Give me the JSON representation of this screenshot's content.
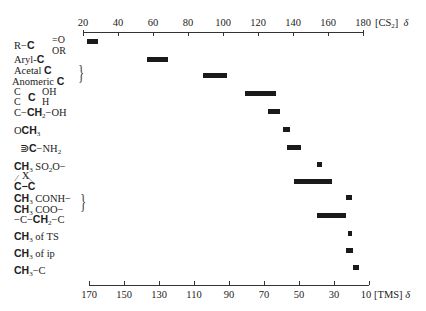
{
  "chart_data": {
    "type": "range-bar",
    "title": "",
    "xlabel_top": "[CS2] δ",
    "xlabel_bottom": "[TMS] δ",
    "top_axis": {
      "unit": "[CS₂]",
      "symbol": "δ",
      "ticks": [
        20,
        40,
        60,
        80,
        100,
        120,
        140,
        160,
        180
      ],
      "range": [
        20,
        180
      ]
    },
    "bottom_axis": {
      "unit": "[TMS]",
      "symbol": "δ",
      "ticks": [
        170,
        150,
        130,
        110,
        90,
        70,
        50,
        30,
        10
      ],
      "range": [
        170,
        10
      ]
    },
    "grid": false,
    "legend": null,
    "categories": [
      "R−C(=O)OR",
      "Aryl-C",
      "Acetal C / Anomeric C",
      "C−C(OH)(H)−C",
      "C−CH₂−OH",
      "OCH₃",
      "≥C−NH₂",
      "CH₃SO₂O−",
      "C−C (bridged by X)",
      "CH₃CONH− / CH₃COO−",
      "−C−CH₂−C",
      "CH₃ of TS",
      "CH₃ of ip",
      "CH₃−C"
    ],
    "series": [
      {
        "name": "chemical shift range (TMS δ)",
        "ranges": [
          [
            165,
            171
          ],
          [
            125,
            137
          ],
          [
            91,
            105
          ],
          [
            63,
            81
          ],
          [
            61,
            68
          ],
          [
            55,
            59
          ],
          [
            49,
            57
          ],
          [
            37,
            40
          ],
          [
            31,
            53
          ],
          [
            20,
            23
          ],
          [
            23,
            40
          ],
          [
            20,
            22
          ],
          [
            19,
            23
          ],
          [
            16,
            19
          ]
        ]
      }
    ]
  },
  "labels": {
    "row1": {
      "pre": "R−",
      "bold": "C",
      "post": "",
      "sup1": "=O",
      "sub1": "OR"
    },
    "row2": {
      "pre": "Aryl-",
      "bold": "C"
    },
    "row3a": {
      "pre": "Acetal ",
      "bold": "C"
    },
    "row3b": {
      "pre": "Anomeric ",
      "bold": "C"
    },
    "row4": {
      "left_top": "C",
      "left_bot": "C",
      "bold": "C",
      "right_top": "OH",
      "right_bot": "H"
    },
    "row5": {
      "pre": "C−",
      "bold": "CH",
      "sub": "2",
      "post": "−OH"
    },
    "row6": {
      "pre": "O",
      "bold": "CH",
      "sub": "3"
    },
    "row7": {
      "pre": "⋑",
      "bold": "C",
      "post": "−NH",
      "sub": "2"
    },
    "row8": {
      "bold": "CH",
      "sub": "3",
      "post": " SO",
      "sub2": "2",
      "post2": "O−"
    },
    "row9": {
      "x": "X",
      "bold": "C−C"
    },
    "row10a": {
      "bold": "CH",
      "sub": "3",
      "post": " CONH−"
    },
    "row10b": {
      "bold": "CH",
      "sub": "3",
      "post": " COO−"
    },
    "row11": {
      "pre": "−C−",
      "bold": "CH",
      "sub": "2",
      "post": "−C"
    },
    "row12": {
      "bold": "CH",
      "sub": "3",
      "post": " of TS"
    },
    "row13": {
      "bold": "CH",
      "sub": "3",
      "post": " of ip"
    },
    "row14": {
      "bold": "CH",
      "sub": "3",
      "post": "−C"
    }
  },
  "axis_text": {
    "top_ticks": [
      "20",
      "40",
      "60",
      "80",
      "100",
      "120",
      "140",
      "160",
      "180"
    ],
    "top_unit": "[CS",
    "top_unit_sub": "2",
    "top_unit_end": "]",
    "top_symbol": "δ",
    "bottom_ticks": [
      "170",
      "150",
      "130",
      "110",
      "90",
      "70",
      "50",
      "30",
      "10"
    ],
    "bottom_unit": "[TMS]",
    "bottom_symbol": "δ"
  }
}
